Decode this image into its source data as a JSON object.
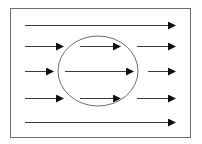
{
  "diagram": {
    "title": "Flow lines around a circular obstacle",
    "colors": {
      "background": "#ffffff",
      "frame_stroke": "#6e6e6e",
      "circle_stroke": "#6e6e6e",
      "arrow_stroke": "#3a3a3a",
      "arrow_head": "#111111"
    },
    "frame": {
      "x": 10,
      "y": 8,
      "width": 180,
      "height": 129
    },
    "circle": {
      "cx": 98,
      "cy": 71,
      "rx": 40,
      "ry": 35
    },
    "rows": [
      {
        "y": 25,
        "arrows": [
          {
            "x1": 25,
            "x2": 175
          }
        ]
      },
      {
        "y": 46,
        "arrows": [
          {
            "x1": 25,
            "x2": 63
          },
          {
            "x1": 80,
            "x2": 120
          },
          {
            "x1": 137,
            "x2": 175
          }
        ]
      },
      {
        "y": 71,
        "arrows": [
          {
            "x1": 25,
            "x2": 53
          },
          {
            "x1": 65,
            "x2": 133
          },
          {
            "x1": 148,
            "x2": 175
          }
        ]
      },
      {
        "y": 98,
        "arrows": [
          {
            "x1": 25,
            "x2": 63
          },
          {
            "x1": 80,
            "x2": 120
          },
          {
            "x1": 137,
            "x2": 175
          }
        ]
      },
      {
        "y": 122,
        "arrows": [
          {
            "x1": 25,
            "x2": 175
          }
        ]
      }
    ]
  }
}
